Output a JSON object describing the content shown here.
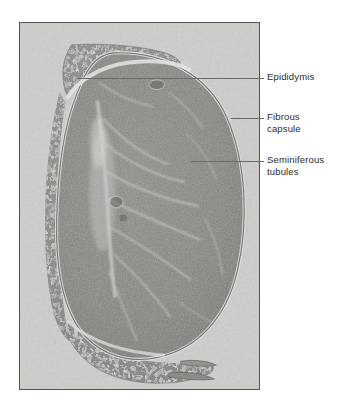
{
  "figure": {
    "kind": "histology-micrograph",
    "stain_tone": "grayscale",
    "frame": {
      "x": 19,
      "y": 22,
      "width": 241,
      "height": 368,
      "border_color": "#555350",
      "background_color": "#cfcecb"
    },
    "page_background": "#ffffff"
  },
  "annotations": [
    {
      "id": "epididymis",
      "label": "Epididymis",
      "label_x": 267,
      "label_y": 70,
      "leader": {
        "x1": 78,
        "y1": 78,
        "x2": 264,
        "y2": 78
      },
      "tick": {
        "x": 258,
        "y1": 70,
        "y2": 86
      },
      "color": "#2b2a28",
      "line_color": "#6c6a67"
    },
    {
      "id": "fibrous-capsule",
      "label": "Fibrous\ncapsule",
      "label_x": 267,
      "label_y": 110,
      "leader": {
        "x1": 231,
        "y1": 118,
        "x2": 264,
        "y2": 118
      },
      "tick": {
        "x": 258,
        "y1": 110,
        "y2": 126
      },
      "color": "#2b2a28",
      "line_color": "#6c6a67"
    },
    {
      "id": "seminiferous-tubules",
      "label": "Seminiferous\ntubules",
      "label_x": 267,
      "label_y": 155,
      "leader": {
        "x1": 191,
        "y1": 161,
        "x2": 264,
        "y2": 161
      },
      "tick": {
        "x": 258,
        "y1": 153,
        "y2": 169
      },
      "color": "#2b2a28",
      "line_color": "#6c6a67"
    }
  ],
  "structures": [
    {
      "id": "testis-body",
      "name": "Testis parenchyma (seminiferous tubules)"
    },
    {
      "id": "epididymis-head",
      "name": "Epididymis, head (upper left)"
    },
    {
      "id": "epididymis-body",
      "name": "Epididymis, body (left margin)"
    },
    {
      "id": "epididymis-tail",
      "name": "Epididymis, tail (lower margin)"
    },
    {
      "id": "tunica-albuginea",
      "name": "Fibrous capsule / tunica albuginea"
    },
    {
      "id": "mediastinum",
      "name": "Mediastinum testis / rete testis septa"
    }
  ]
}
